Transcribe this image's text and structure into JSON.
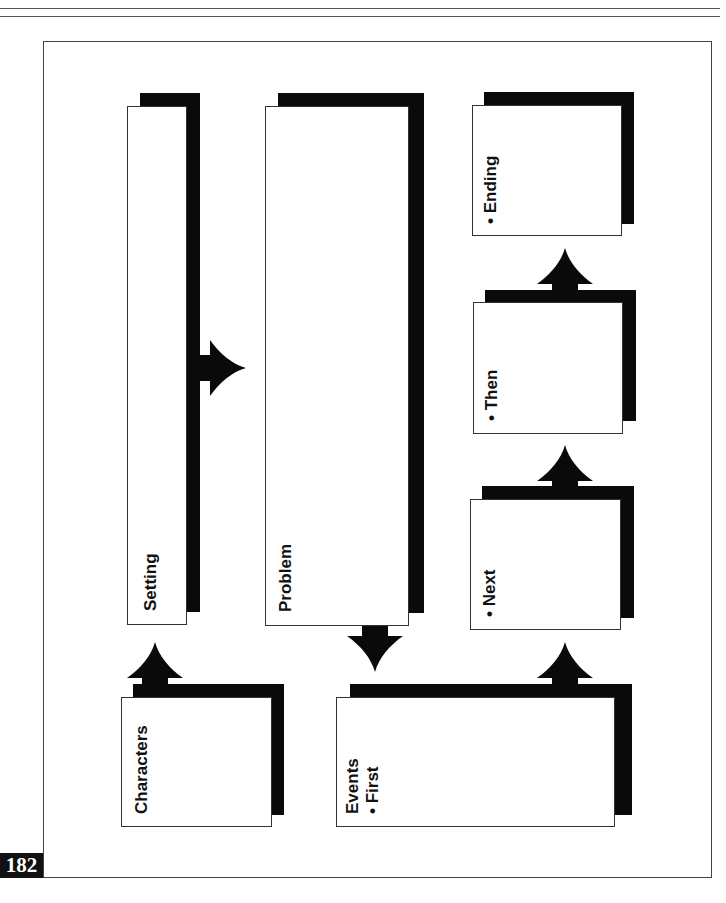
{
  "page": {
    "page_number": "182",
    "header_rules": 2
  },
  "diagram": {
    "boxes": {
      "characters": {
        "lines": [
          "Characters"
        ]
      },
      "setting": {
        "lines": [
          "Setting"
        ]
      },
      "problem": {
        "lines": [
          "Problem"
        ]
      },
      "events": {
        "lines": [
          "Events",
          "• First"
        ]
      },
      "next": {
        "lines": [
          "• Next"
        ]
      },
      "then": {
        "lines": [
          "• Then"
        ]
      },
      "ending": {
        "lines": [
          "• Ending"
        ]
      }
    },
    "arrows": [
      {
        "from": "Characters",
        "to": "Setting",
        "icon": "arrow-up-icon"
      },
      {
        "from": "Setting",
        "to": "Problem",
        "icon": "arrow-right-icon"
      },
      {
        "from": "Problem",
        "to": "Events",
        "icon": "arrow-down-icon"
      },
      {
        "from": "Events",
        "to": "Next",
        "icon": "arrow-up-icon"
      },
      {
        "from": "Next",
        "to": "Then",
        "icon": "arrow-up-icon"
      },
      {
        "from": "Then",
        "to": "Ending",
        "icon": "arrow-up-icon"
      }
    ],
    "colors": {
      "shadow": "#0a0a0a",
      "box_fill": "#ffffff",
      "border": "#333333"
    }
  }
}
